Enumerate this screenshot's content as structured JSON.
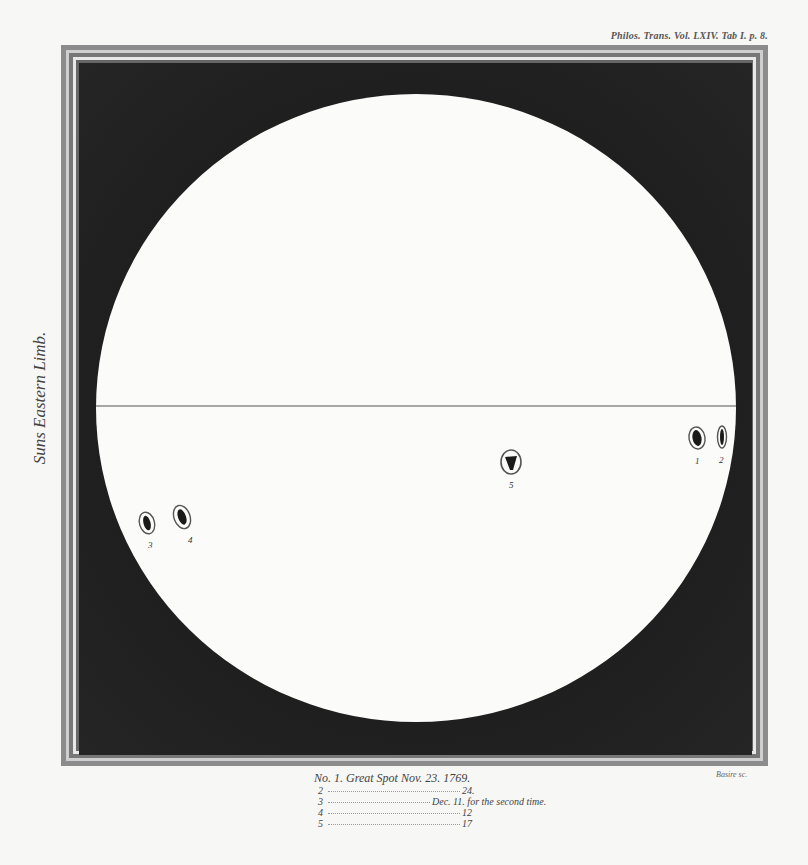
{
  "plate": {
    "reference": "Philos. Trans. Vol. LXIV. Tab I. p. 8.",
    "limb_label": "Suns Eastern Limb.",
    "engraver": "Basire sc."
  },
  "disc": {
    "center_x": 416,
    "center_y": 408,
    "radius_x": 320,
    "radius_y": 314,
    "equator_y": 406,
    "colors": {
      "disc": "#fbfbfa",
      "sky": "#232323",
      "spot": "#1a1a1a"
    }
  },
  "spots": [
    {
      "number": "1",
      "x": 697,
      "y": 438
    },
    {
      "number": "2",
      "x": 722,
      "y": 437
    },
    {
      "number": "3",
      "x": 147,
      "y": 523
    },
    {
      "number": "4",
      "x": 182,
      "y": 517
    },
    {
      "number": "5",
      "x": 511,
      "y": 462
    }
  ],
  "caption": {
    "lines": [
      {
        "num": "No. 1.",
        "text": "Great Spot  Nov. 23. 1769."
      },
      {
        "num": "2",
        "date": "24."
      },
      {
        "num": "3",
        "date": "Dec. 11. for the second time."
      },
      {
        "num": "4",
        "date": "12"
      },
      {
        "num": "5",
        "date": "17"
      }
    ]
  }
}
